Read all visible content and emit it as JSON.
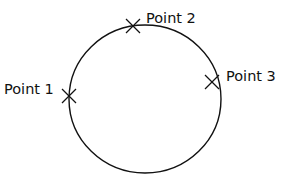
{
  "diagram": {
    "type": "circle-with-points",
    "colors": {
      "stroke": "#111111",
      "background": "#ffffff"
    },
    "circle": {
      "cx": 145,
      "cy": 99,
      "rx": 76,
      "ry": 74
    },
    "points": [
      {
        "label": "Point 1",
        "marker": "x-mark",
        "x": 69,
        "y": 96,
        "label_x": 4,
        "label_y": 94
      },
      {
        "label": "Point 2",
        "marker": "x-mark",
        "x": 133,
        "y": 26,
        "label_x": 146,
        "label_y": 23
      },
      {
        "label": "Point 3",
        "marker": "x-mark",
        "x": 212,
        "y": 82,
        "label_x": 226,
        "label_y": 81
      }
    ]
  }
}
